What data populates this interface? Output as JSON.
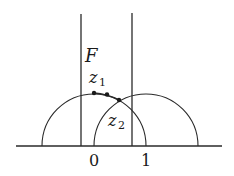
{
  "diagram": {
    "labels": {
      "region": "F",
      "point1_main": "z",
      "point1_sub": "1",
      "point2_main": "z",
      "point2_sub": "2",
      "tick0": "0",
      "tick1": "1"
    },
    "colors": {
      "stroke": "#2a2a2a",
      "background": "#ffffff"
    }
  }
}
